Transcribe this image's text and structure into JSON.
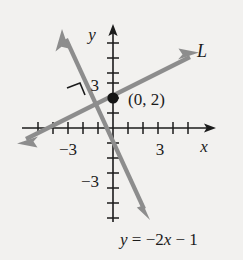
{
  "figure": {
    "background_color": "#f2f1ef",
    "ink_color": "#1b1b1b",
    "line_color": "#8d8d8d",
    "axis": {
      "x_label": "x",
      "y_label": "y",
      "x_tick_labels": [
        {
          "value": -3,
          "text": "−3"
        },
        {
          "value": 3,
          "text": "3"
        }
      ],
      "y_tick_labels": [
        {
          "value": 3,
          "text": "3"
        },
        {
          "value": -3,
          "text": "−3"
        }
      ],
      "origin_px": [
        113,
        128
      ],
      "unit_px": 15,
      "x_range": [
        -6,
        7
      ],
      "y_range": [
        -6,
        6
      ]
    },
    "lines": [
      {
        "name": "L",
        "label": "L",
        "slope": 0.5,
        "intercept": 2,
        "arrow_both_ends": true
      },
      {
        "name": "given-line",
        "label": "y = −2x − 1",
        "label_parts": {
          "y": "y",
          "equals": " = −2",
          "x": "x",
          "tail": " − 1"
        },
        "slope": -2,
        "intercept": -1,
        "arrow_both_ends": true
      }
    ],
    "point": {
      "label": "(0, 2)",
      "coords": [
        0,
        2
      ],
      "filled": true
    },
    "right_angle_marker": {
      "present": true,
      "description": "perpendicular-mark"
    }
  }
}
